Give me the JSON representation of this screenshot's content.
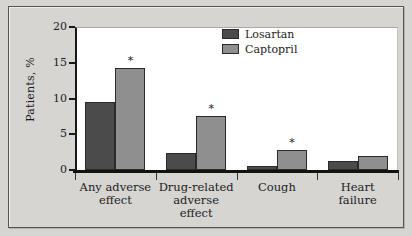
{
  "chart_data": {
    "type": "bar",
    "title": "",
    "subtitle": "",
    "xlabel": "",
    "ylabel": "Patients, %",
    "ylim": [
      0,
      20
    ],
    "yticks": [
      0,
      5,
      10,
      15,
      20
    ],
    "ytick_labels": [
      "0",
      "5",
      "10",
      "15",
      "20"
    ],
    "grid": false,
    "legend_position": "top-right",
    "categories": [
      "Any adverse effect",
      "Drug-related adverse effect",
      "Cough",
      "Heart failure"
    ],
    "category_lines": [
      [
        "Any adverse",
        "effect"
      ],
      [
        "Drug-related",
        "adverse",
        "effect"
      ],
      [
        "Cough"
      ],
      [
        "Heart",
        "failure"
      ]
    ],
    "series": [
      {
        "name": "Losartan",
        "color": "#4b4b4b",
        "values": [
          9.5,
          2.4,
          0.5,
          1.2
        ],
        "significance": [
          "",
          "",
          "",
          ""
        ]
      },
      {
        "name": "Captopril",
        "color": "#8f8f8f",
        "values": [
          14.2,
          7.6,
          2.8,
          2.0
        ],
        "significance": [
          "*",
          "*",
          "*",
          ""
        ]
      }
    ],
    "annotations": [
      {
        "text": "*",
        "category": "Any adverse effect",
        "series": "Captopril"
      },
      {
        "text": "*",
        "category": "Drug-related adverse effect",
        "series": "Captopril"
      },
      {
        "text": "*",
        "category": "Cough",
        "series": "Captopril"
      }
    ]
  },
  "legend": {
    "entries": [
      {
        "label": "Losartan",
        "color": "#4b4b4b"
      },
      {
        "label": "Captopril",
        "color": "#8f8f8f"
      }
    ]
  },
  "colors": {
    "background": "#d6d5d2",
    "plot_background": "#ffffff",
    "axis": "#121212",
    "text": "#1c1c1c",
    "losartan": "#4b4b4b",
    "captopril": "#8f8f8f"
  }
}
